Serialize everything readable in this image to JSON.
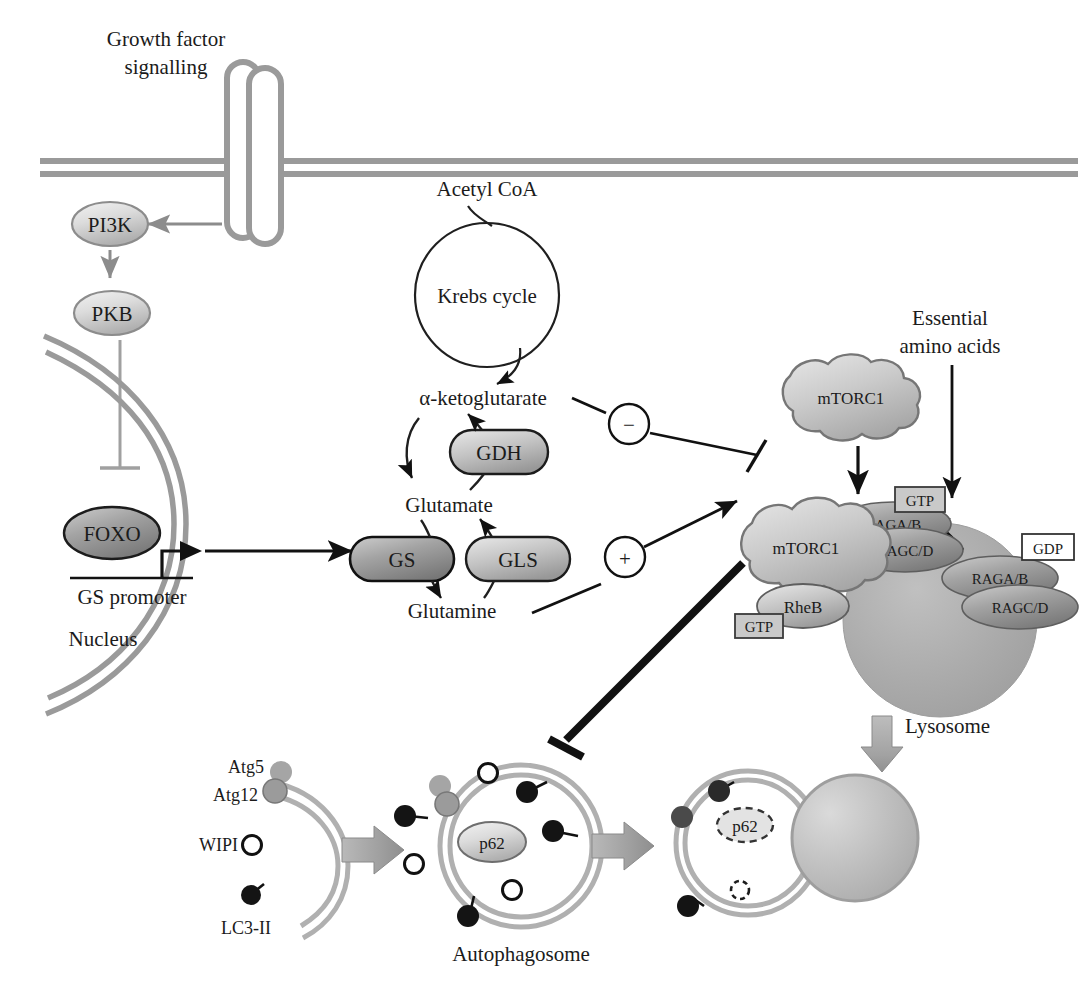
{
  "figure": {
    "domain": "biological-pathway-diagram",
    "background": "#ffffff"
  },
  "colors": {
    "membrane_gray": "#9a9a9a",
    "nucleus_gray": "#9a9a9a",
    "node_fill_light": "#d6d6d6",
    "node_fill_mid": "#b4b4b4",
    "node_fill_dark": "#8f8f8f",
    "lysosome_gray": "#a9a9a9",
    "stroke_dark": "#111111",
    "stroke_gray": "#8c8c8c",
    "white": "#ffffff",
    "black_dot": "#121212",
    "atg5_dot": "#9e9e9e",
    "atg12_dot": "#8a8a8a"
  },
  "labels": {
    "growth_factor": "Growth factor",
    "signalling": "signalling",
    "acetyl_coa": "Acetyl CoA",
    "krebs_cycle": "Krebs cycle",
    "alpha_ketoglutarate": "α-ketoglutarate",
    "glutamate": "Glutamate",
    "glutamine": "Glutamine",
    "gs_promoter": "GS promoter",
    "nucleus": "Nucleus",
    "essential_amino_acids_1": "Essential",
    "essential_amino_acids_2": "amino acids",
    "lysosome": "Lysosome",
    "autophagosome": "Autophagosome",
    "atg5": "Atg5",
    "atg12": "Atg12",
    "wipi": "WIPI",
    "lc3ii": "LC3-II"
  },
  "nodes": {
    "pi3k": "PI3K",
    "pkb": "PKB",
    "foxo": "FOXO",
    "gdh": "GDH",
    "gs": "GS",
    "gls": "GLS",
    "mtorc1_free": "mTORC1",
    "mtorc1_lyso": "mTORC1",
    "rheb": "RheB",
    "raga_b_active": "RAGA/B",
    "ragc_d_active": "RAGC/D",
    "raga_b_inactive": "RAGA/B",
    "ragc_d_inactive": "RAGC/D",
    "gtp_rag": "GTP",
    "gtp_rheb": "GTP",
    "gdp_rag": "GDP",
    "p62_autophagosome": "p62",
    "p62_autolysosome": "p62"
  },
  "modifiers": {
    "negative": "−",
    "positive": "+"
  },
  "edges": [
    {
      "name": "receptor-to-pi3k",
      "kind": "activation-arrow",
      "from": "receptor",
      "to": "pi3k"
    },
    {
      "name": "pi3k-to-pkb",
      "kind": "activation-arrow",
      "from": "pi3k",
      "to": "pkb"
    },
    {
      "name": "pkb-inhibits-foxo",
      "kind": "inhibition-bar",
      "from": "pkb",
      "to": "foxo"
    },
    {
      "name": "gs-promoter-transcription",
      "kind": "transcription-arrow",
      "from": "gs-promoter",
      "to": "gs"
    },
    {
      "name": "acetylcoa-into-krebs",
      "kind": "curved-arrow",
      "from": "acetyl-coa",
      "to": "krebs-cycle"
    },
    {
      "name": "krebs-to-akg",
      "kind": "curved-arrow",
      "from": "krebs-cycle",
      "to": "alpha-ketoglutarate"
    },
    {
      "name": "glutamate-to-akg-via-gdh",
      "kind": "enzyme-arrow",
      "from": "glutamate",
      "to": "alpha-ketoglutarate"
    },
    {
      "name": "akg-to-glutamate",
      "kind": "curved-arrow",
      "from": "alpha-ketoglutarate",
      "to": "glutamate"
    },
    {
      "name": "glutamate-to-glutamine-via-gs",
      "kind": "enzyme-arrow",
      "from": "glutamate",
      "to": "glutamine"
    },
    {
      "name": "glutamine-to-glutamate-via-gls",
      "kind": "enzyme-arrow",
      "from": "glutamine",
      "to": "glutamate"
    },
    {
      "name": "akg-inhibits-mtorc1",
      "kind": "inhibition-bar",
      "from": "alpha-ketoglutarate",
      "to": "mtorc1-lysosome",
      "modifier": "−"
    },
    {
      "name": "glutamine-activates-mtorc1",
      "kind": "activation-arrow",
      "from": "glutamine",
      "to": "mtorc1-lysosome",
      "modifier": "+"
    },
    {
      "name": "mtorc1-recruitment",
      "kind": "activation-arrow",
      "from": "mtorc1-free",
      "to": "mtorc1-lysosome"
    },
    {
      "name": "amino-acids-to-rag",
      "kind": "activation-arrow",
      "from": "essential-amino-acids",
      "to": "rag-gtp"
    },
    {
      "name": "rag-gdp-to-gtp",
      "kind": "curved-arrow",
      "from": "rag-gdp",
      "to": "rag-gtp"
    },
    {
      "name": "mtorc1-inhibits-autophagy",
      "kind": "thick-inhibition-bar",
      "from": "mtorc1-lysosome",
      "to": "autophagosome"
    },
    {
      "name": "phagophore-to-autophagosome",
      "kind": "block-arrow",
      "from": "phagophore",
      "to": "autophagosome"
    },
    {
      "name": "autophagosome-to-autolysosome",
      "kind": "block-arrow",
      "from": "autophagosome",
      "to": "autolysosome"
    },
    {
      "name": "lysosome-fusion",
      "kind": "block-arrow-down",
      "from": "lysosome",
      "to": "autolysosome"
    }
  ],
  "counts": {
    "wipi_on_autophagosome": 3,
    "lc3ii_on_autophagosome": 4,
    "atg5_atg12_pairs": 1
  }
}
